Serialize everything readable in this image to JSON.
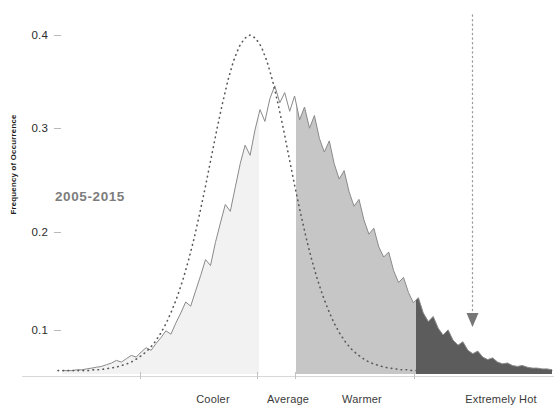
{
  "chart_data": {
    "type": "area",
    "title": "",
    "subtitle": "",
    "xlabel": "",
    "ylabel": "Frequency of Occurrence",
    "ylim": [
      0,
      0.43
    ],
    "ytick_labels": [
      "0.1",
      "0.2",
      "0.3",
      "0.4"
    ],
    "ytick_values": [
      0.1,
      0.2,
      0.3,
      0.4
    ],
    "xtick_labels": [
      "Cooler",
      "Average",
      "Warmer",
      "Extremely Hot"
    ],
    "grid": false,
    "legend_position": "inline-annotation",
    "annotations": [
      {
        "text": "2005-2015",
        "type": "series-label",
        "color": "#7d7d7d"
      },
      {
        "text": "",
        "type": "arrow",
        "style": "dotted-vertical-down"
      }
    ],
    "series": [
      {
        "name": "Baseline distribution",
        "style": "dotted",
        "color": "#5a5a5a",
        "peak_value": 0.4,
        "peak_category": "Average",
        "values": [
          0.004,
          0.004,
          0.004,
          0.004,
          0.004,
          0.004,
          0.005,
          0.005,
          0.006,
          0.007,
          0.008,
          0.01,
          0.012,
          0.015,
          0.019,
          0.024,
          0.03,
          0.038,
          0.048,
          0.06,
          0.075,
          0.092,
          0.112,
          0.135,
          0.161,
          0.19,
          0.221,
          0.254,
          0.287,
          0.318,
          0.346,
          0.369,
          0.386,
          0.396,
          0.4,
          0.396,
          0.386,
          0.369,
          0.346,
          0.318,
          0.287,
          0.254,
          0.221,
          0.19,
          0.161,
          0.135,
          0.112,
          0.092,
          0.075,
          0.06,
          0.048,
          0.038,
          0.03,
          0.024,
          0.019,
          0.015,
          0.012,
          0.01,
          0.008,
          0.007,
          0.006,
          0.005,
          0.005,
          0.004,
          0.004
        ]
      },
      {
        "name": "2005-2015 distribution",
        "style": "solid-jagged",
        "color": "#7a7a7a",
        "peak_value": 0.34,
        "peak_category": "Warmer",
        "values": [
          0.004,
          0.004,
          0.004,
          0.005,
          0.005,
          0.006,
          0.007,
          0.008,
          0.009,
          0.011,
          0.013,
          0.016,
          0.014,
          0.018,
          0.022,
          0.02,
          0.026,
          0.031,
          0.028,
          0.036,
          0.043,
          0.051,
          0.047,
          0.06,
          0.072,
          0.085,
          0.08,
          0.098,
          0.116,
          0.135,
          0.128,
          0.155,
          0.178,
          0.2,
          0.192,
          0.22,
          0.248,
          0.27,
          0.258,
          0.288,
          0.312,
          0.298,
          0.325,
          0.34,
          0.32,
          0.332,
          0.31,
          0.328,
          0.3,
          0.315,
          0.29,
          0.305,
          0.278,
          0.262,
          0.275,
          0.248,
          0.23,
          0.24,
          0.215,
          0.198,
          0.206,
          0.182,
          0.165,
          0.172,
          0.15,
          0.138,
          0.144,
          0.122,
          0.108,
          0.114,
          0.096,
          0.084,
          0.09,
          0.072,
          0.062,
          0.068,
          0.054,
          0.046,
          0.052,
          0.04,
          0.034,
          0.038,
          0.028,
          0.024,
          0.027,
          0.02,
          0.017,
          0.019,
          0.014,
          0.012,
          0.013,
          0.01,
          0.009,
          0.01,
          0.008,
          0.007,
          0.007,
          0.006,
          0.006,
          0.005
        ]
      }
    ],
    "shaded_regions": [
      {
        "label": "Cooler",
        "color": "#f2f2f2",
        "x_start_frac": 0.0,
        "x_end_frac": 0.43
      },
      {
        "label": "Warmer",
        "color": "#c6c6c6",
        "x_start_frac": 0.5,
        "x_end_frac": 0.745
      },
      {
        "label": "Extremely Hot",
        "color": "#5c5c5c",
        "x_start_frac": 0.745,
        "x_end_frac": 1.0
      }
    ]
  },
  "axis": {
    "y_label": "Frequency of Occurrence",
    "y_ticks": [
      {
        "label": "0.4",
        "y": 29
      },
      {
        "label": "0.3",
        "y": 122
      },
      {
        "label": "0.2",
        "y": 226
      },
      {
        "label": "0.1",
        "y": 324
      }
    ],
    "x_ticks": [
      {
        "label": "Cooler",
        "tick_x": 140,
        "label_x": 213
      },
      {
        "label": "Average",
        "tick_x": 257,
        "label_x": 288
      },
      {
        "label": "Warmer",
        "tick_x": 295,
        "label_x": 362
      },
      {
        "label": "Extremely Hot",
        "tick_x": 414,
        "label_x": 501
      }
    ]
  },
  "annotation": {
    "series_label": "2005-2015"
  },
  "colors": {
    "background": "#ffffff",
    "axis_line": "#d2d2d2",
    "tick": "#c2c2c2",
    "text": "#2b2b2b",
    "fill_cooler": "#f2f2f2",
    "fill_warmer": "#c6c6c6",
    "fill_extreme": "#5c5c5c",
    "curve_solid": "#7a7a7a",
    "curve_dotted": "#5a5a5a",
    "annotation_label": "#7d7d7d"
  }
}
